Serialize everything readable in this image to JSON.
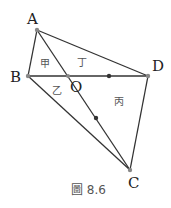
{
  "diagram": {
    "points": {
      "A": {
        "label": "A",
        "x": 37,
        "y": 30
      },
      "B": {
        "label": "B",
        "x": 28,
        "y": 76
      },
      "C": {
        "label": "C",
        "x": 130,
        "y": 170
      },
      "D": {
        "label": "D",
        "x": 148,
        "y": 76
      },
      "O": {
        "label": "O",
        "x": 68,
        "y": 76
      }
    },
    "regions": {
      "jia": "甲",
      "ding": "丁",
      "yi": "乙",
      "bing": "丙"
    },
    "caption": "圖 8.6",
    "colors": {
      "line": "#333333",
      "point": "#888888"
    }
  }
}
